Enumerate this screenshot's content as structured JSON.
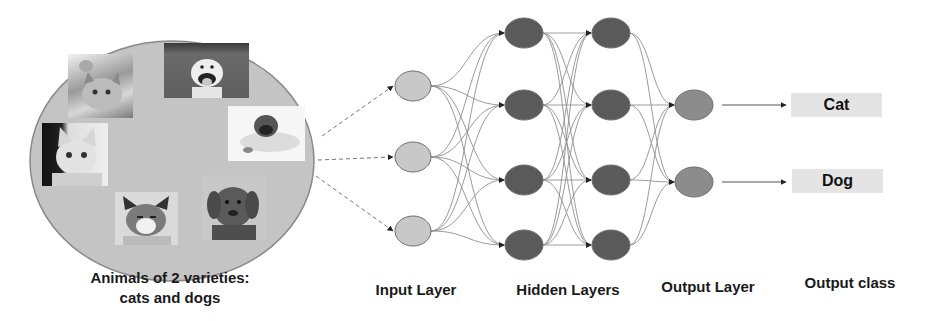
{
  "dataset": {
    "caption_line1": "Animals of 2 varieties:",
    "caption_line2": "cats and dogs",
    "images": [
      {
        "label": "cat-waving-photo",
        "kind": "cat"
      },
      {
        "label": "pitbull-smiling-photo",
        "kind": "dog"
      },
      {
        "label": "pug-lying-photo",
        "kind": "dog"
      },
      {
        "label": "white-cat-photo",
        "kind": "cat"
      },
      {
        "label": "grumpy-cat-photo",
        "kind": "cat"
      },
      {
        "label": "retriever-photo",
        "kind": "dog"
      }
    ]
  },
  "network": {
    "input_layer": {
      "label": "Input Layer",
      "nodes": 3
    },
    "hidden_layers": {
      "label": "Hidden Layers",
      "layers": 2,
      "nodes_per_layer": 4
    },
    "output_layer": {
      "label": "Output Layer",
      "nodes": 2
    }
  },
  "output_class": {
    "label": "Output class",
    "classes": [
      "Cat",
      "Dog"
    ]
  },
  "colors": {
    "ellipse_fill": "#c4c4c4",
    "ellipse_stroke": "#8a8a8a",
    "input_node": "#c8c8c8",
    "hidden_node": "#5a5a5a",
    "output_node": "#8c8c8c",
    "edge": "#8f8f8f",
    "class_box": "#e4e4e4"
  }
}
